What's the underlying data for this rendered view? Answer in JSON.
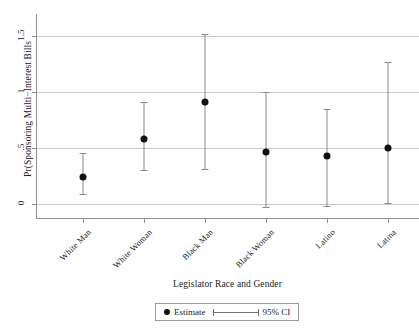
{
  "chart_data": {
    "type": "scatter",
    "title": "",
    "xlabel": "Legislator Race and Gender",
    "ylabel": "Pr(Sponsoring Multi−Interest Bills",
    "categories": [
      "White Man",
      "White Woman",
      "Black Man",
      "Black Woman",
      "Latino",
      "Latina"
    ],
    "values": [
      0.24,
      0.58,
      0.91,
      0.46,
      0.43,
      0.5
    ],
    "ci_low": [
      0.09,
      0.3,
      0.31,
      -0.03,
      -0.02,
      0.01
    ],
    "ci_high": [
      0.45,
      0.91,
      1.52,
      1.0,
      0.85,
      1.27
    ],
    "ylim": [
      -0.12,
      1.63
    ],
    "yticks": [
      0,
      0.5,
      1,
      1.5
    ],
    "ytick_labels": [
      "0",
      ".5",
      "1",
      "1.5"
    ],
    "grid": true,
    "legend_position": "bottom",
    "series": [
      {
        "name": "Estimate",
        "values": [
          0.24,
          0.58,
          0.91,
          0.46,
          0.43,
          0.5
        ]
      },
      {
        "name": "95% CI",
        "low": [
          0.09,
          0.3,
          0.31,
          -0.03,
          -0.02,
          0.01
        ],
        "high": [
          0.45,
          0.91,
          1.52,
          1.0,
          0.85,
          1.27
        ]
      }
    ]
  },
  "legend": {
    "estimate_label": "Estimate",
    "ci_label": "95% CI"
  },
  "colors": {
    "marker": "#101010",
    "ci": "#8a8a8a",
    "grid": "#c9c9c9",
    "axis": "#8d8d8d",
    "background": "#ffffff"
  }
}
